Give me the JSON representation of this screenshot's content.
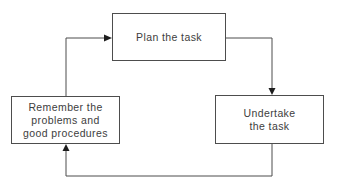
{
  "diagram": {
    "nodes": [
      {
        "id": "plan",
        "label": "Plan the task"
      },
      {
        "id": "undertake",
        "label": "Undertake\nthe task"
      },
      {
        "id": "remember",
        "label": "Remember the\nproblems and\ngood procedures"
      }
    ],
    "edges": [
      {
        "from": "remember",
        "to": "plan"
      },
      {
        "from": "plan",
        "to": "undertake"
      },
      {
        "from": "undertake",
        "to": "remember"
      }
    ],
    "colors": {
      "background": "#ffffff",
      "box_border": "#4d4d4d",
      "text": "#3d3d3d",
      "line": "#4d4d4d",
      "arrowhead": "#1d1d1d"
    }
  }
}
